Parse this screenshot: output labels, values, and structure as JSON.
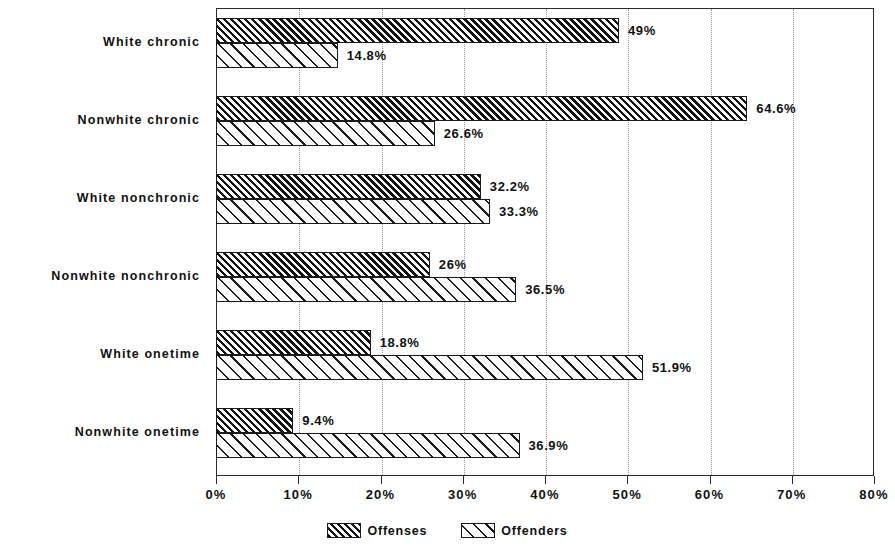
{
  "chart_data": {
    "type": "bar",
    "orientation": "horizontal",
    "title": "",
    "subtitle": "",
    "xlabel": "",
    "ylabel": "",
    "xlim": [
      0,
      80
    ],
    "xtick_labels": [
      "0%",
      "10%",
      "20%",
      "30%",
      "40%",
      "50%",
      "60%",
      "70%",
      "80%"
    ],
    "xticks": [
      0,
      10,
      20,
      30,
      40,
      50,
      60,
      70,
      80
    ],
    "grid": "vertical-dotted",
    "legend_position": "bottom-center",
    "categories": [
      "White chronic",
      "Nonwhite chronic",
      "White nonchronic",
      "Nonwhite nonchronic",
      "White onetime",
      "Nonwhite onetime"
    ],
    "series": [
      {
        "name": "Offenses",
        "pattern": "dense-diagonal-hatch",
        "values": [
          49,
          64.6,
          32.2,
          26,
          18.8,
          9.4
        ],
        "labels": [
          "49%",
          "64.6%",
          "32.2%",
          "26%",
          "18.8%",
          "9.4%"
        ]
      },
      {
        "name": "Offenders",
        "pattern": "sparse-diagonal-hatch",
        "values": [
          14.8,
          26.6,
          33.3,
          36.5,
          51.9,
          36.9
        ],
        "labels": [
          "14.8%",
          "26.6%",
          "33.3%",
          "36.5%",
          "51.9%",
          "36.9%"
        ]
      }
    ]
  },
  "legend": {
    "items": [
      {
        "label": "Offenses",
        "pattern": "dense-diagonal-hatch"
      },
      {
        "label": "Offenders",
        "pattern": "sparse-diagonal-hatch"
      }
    ]
  },
  "colors": {
    "axis": "#2b2b2b",
    "grid": "#9a9a9a",
    "hatch": "#111111",
    "background": "#ffffff",
    "text": "#111111"
  }
}
